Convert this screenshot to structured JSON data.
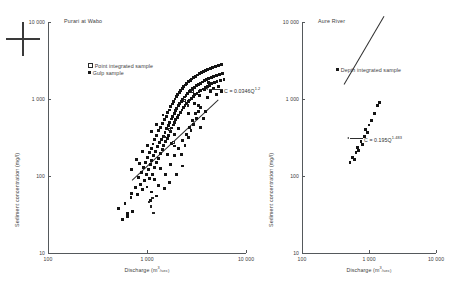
{
  "figure": {
    "registration_mark": "crosshair"
  },
  "panels": [
    {
      "id": "purari",
      "title": "Purari at Wabo",
      "xlabel_text": "Discharge (m",
      "xlabel_sup": "3",
      "xlabel_tail": "/sec)",
      "ylabel": "Sediment concentration (mg/l)",
      "xticks": [
        "100",
        "1 000",
        "10 000"
      ],
      "yticks": [
        "10",
        "100",
        "1 000",
        "10 000"
      ],
      "legend": [
        {
          "marker": "open",
          "label": "Point integrated sample"
        },
        {
          "marker": "filled",
          "label": "Gulp sample"
        }
      ],
      "equation": {
        "prefix": "C = 0.0346Q",
        "exponent": "1.2"
      }
    },
    {
      "id": "aure",
      "title": "Aure River",
      "xlabel_text": "Discharge (m",
      "xlabel_sup": "3",
      "xlabel_tail": "/sec)",
      "ylabel": "Sediment concentration (mg/l)",
      "xticks": [
        "100",
        "1 000",
        "10 000"
      ],
      "yticks": [
        "10",
        "100",
        "1 000",
        "10 000"
      ],
      "legend": [
        {
          "marker": "filled",
          "label": "Depth integrated sample"
        }
      ],
      "equation": {
        "prefix": "C = 0.195Q",
        "exponent": "1.483"
      }
    }
  ],
  "chart_data": [
    {
      "type": "scatter",
      "title": "Purari at Wabo",
      "xlabel": "Discharge (m3/sec)",
      "ylabel": "Sediment concentration (mg/l)",
      "xscale": "log",
      "yscale": "log",
      "xlim": [
        100,
        10000
      ],
      "ylim": [
        10,
        10000
      ],
      "grid": false,
      "legend_position": "upper-left-inside",
      "annotations": [
        {
          "text": "C = 0.0346Q^1.2",
          "kind": "regression-equation",
          "leader": true
        }
      ],
      "fit": {
        "coefficient": 0.0346,
        "exponent": 1.2,
        "form": "C = aQ^b"
      },
      "series": [
        {
          "name": "Gulp sample",
          "marker": "filled-square",
          "points": [
            [
              520,
              38
            ],
            [
              600,
              44
            ],
            [
              640,
              33
            ],
            [
              700,
              60
            ],
            [
              690,
              52
            ],
            [
              760,
              70
            ],
            [
              800,
              58
            ],
            [
              820,
              95
            ],
            [
              860,
              78
            ],
            [
              880,
              110
            ],
            [
              900,
              66
            ],
            [
              920,
              130
            ],
            [
              940,
              88
            ],
            [
              960,
              150
            ],
            [
              980,
              105
            ],
            [
              1000,
              72
            ],
            [
              1010,
              175
            ],
            [
              1030,
              120
            ],
            [
              1050,
              200
            ],
            [
              1060,
              92
            ],
            [
              1080,
              140
            ],
            [
              1100,
              230
            ],
            [
              1120,
              160
            ],
            [
              1140,
              105
            ],
            [
              1150,
              260
            ],
            [
              1170,
              185
            ],
            [
              1190,
              130
            ],
            [
              1200,
              300
            ],
            [
              1220,
              210
            ],
            [
              1240,
              150
            ],
            [
              1260,
              340
            ],
            [
              1280,
              240
            ],
            [
              1300,
              170
            ],
            [
              1320,
              390
            ],
            [
              1340,
              270
            ],
            [
              1360,
              195
            ],
            [
              1380,
              430
            ],
            [
              1400,
              300
            ],
            [
              1420,
              220
            ],
            [
              1440,
              480
            ],
            [
              1460,
              330
            ],
            [
              1480,
              250
            ],
            [
              1500,
              540
            ],
            [
              1520,
              370
            ],
            [
              1540,
              280
            ],
            [
              1560,
              600
            ],
            [
              1580,
              410
            ],
            [
              1600,
              310
            ],
            [
              1620,
              660
            ],
            [
              1640,
              450
            ],
            [
              1660,
              340
            ],
            [
              1680,
              720
            ],
            [
              1700,
              500
            ],
            [
              1720,
              380
            ],
            [
              1740,
              790
            ],
            [
              1760,
              550
            ],
            [
              1780,
              420
            ],
            [
              1800,
              860
            ],
            [
              1820,
              600
            ],
            [
              1840,
              460
            ],
            [
              1860,
              930
            ],
            [
              1880,
              650
            ],
            [
              1900,
              500
            ],
            [
              1920,
              1000
            ],
            [
              1940,
              700
            ],
            [
              1960,
              540
            ],
            [
              1980,
              1080
            ],
            [
              2000,
              760
            ],
            [
              2020,
              580
            ],
            [
              2050,
              1150
            ],
            [
              2080,
              820
            ],
            [
              2100,
              620
            ],
            [
              2120,
              1230
            ],
            [
              2150,
              880
            ],
            [
              2180,
              670
            ],
            [
              2200,
              1300
            ],
            [
              2230,
              940
            ],
            [
              2260,
              720
            ],
            [
              2280,
              1380
            ],
            [
              2300,
              1000
            ],
            [
              2330,
              770
            ],
            [
              2360,
              1450
            ],
            [
              2390,
              1060
            ],
            [
              2420,
              820
            ],
            [
              2450,
              1520
            ],
            [
              2480,
              1120
            ],
            [
              2500,
              870
            ],
            [
              2530,
              1600
            ],
            [
              2560,
              1180
            ],
            [
              2600,
              920
            ],
            [
              2630,
              1680
            ],
            [
              2660,
              1240
            ],
            [
              2700,
              970
            ],
            [
              2730,
              1750
            ],
            [
              2760,
              1300
            ],
            [
              2800,
              1020
            ],
            [
              2840,
              1820
            ],
            [
              2880,
              1360
            ],
            [
              2920,
              1080
            ],
            [
              2960,
              1900
            ],
            [
              3000,
              1420
            ],
            [
              3050,
              1130
            ],
            [
              3100,
              1980
            ],
            [
              3150,
              1480
            ],
            [
              3200,
              1180
            ],
            [
              3250,
              2050
            ],
            [
              3300,
              1540
            ],
            [
              3350,
              1240
            ],
            [
              3400,
              2130
            ],
            [
              3450,
              1600
            ],
            [
              3500,
              1290
            ],
            [
              3560,
              2200
            ],
            [
              3620,
              1660
            ],
            [
              3680,
              1350
            ],
            [
              3740,
              2280
            ],
            [
              3800,
              1720
            ],
            [
              3860,
              1400
            ],
            [
              3920,
              2350
            ],
            [
              3980,
              1780
            ],
            [
              4050,
              1460
            ],
            [
              4120,
              2430
            ],
            [
              4200,
              1840
            ],
            [
              4280,
              1510
            ],
            [
              4360,
              2500
            ],
            [
              4440,
              1900
            ],
            [
              4520,
              1570
            ],
            [
              4600,
              2580
            ],
            [
              4700,
              1960
            ],
            [
              4800,
              1620
            ],
            [
              4900,
              2650
            ],
            [
              5000,
              2020
            ],
            [
              5100,
              1680
            ],
            [
              5250,
              2730
            ],
            [
              5400,
              2080
            ],
            [
              5550,
              1740
            ],
            [
              5700,
              2800
            ],
            [
              5850,
              2140
            ],
            [
              6000,
              1800
            ],
            [
              900,
              210
            ],
            [
              1100,
              380
            ],
            [
              1250,
              470
            ],
            [
              1450,
              620
            ],
            [
              1600,
              190
            ],
            [
              1750,
              265
            ],
            [
              1900,
              350
            ],
            [
              2100,
              410
            ],
            [
              2300,
              290
            ],
            [
              2500,
              350
            ],
            [
              2700,
              430
            ],
            [
              2900,
              520
            ],
            [
              3100,
              640
            ],
            [
              3300,
              830
            ],
            [
              3500,
              430
            ],
            [
              3700,
              560
            ],
            [
              3900,
              690
            ],
            [
              4100,
              1050
            ],
            [
              4400,
              1250
            ],
            [
              4700,
              1380
            ],
            [
              5000,
              1150
            ],
            [
              5300,
              1450
            ],
            [
              5600,
              1250
            ],
            [
              700,
              120
            ],
            [
              780,
              165
            ],
            [
              840,
              145
            ],
            [
              1020,
              250
            ],
            [
              1180,
              90
            ],
            [
              1360,
              125
            ],
            [
              1540,
              105
            ],
            [
              1720,
              140
            ],
            [
              1880,
              185
            ],
            [
              2060,
              230
            ],
            [
              2240,
              190
            ],
            [
              2420,
              250
            ],
            [
              2600,
              320
            ],
            [
              2780,
              390
            ],
            [
              2960,
              470
            ],
            [
              3140,
              560
            ],
            [
              3320,
              680
            ],
            [
              3500,
              780
            ],
            [
              1100,
              62
            ],
            [
              1300,
              75
            ],
            [
              1500,
              68
            ],
            [
              1700,
              82
            ],
            [
              2000,
              105
            ],
            [
              2300,
              135
            ],
            [
              560,
              27
            ],
            [
              640,
              30
            ],
            [
              720,
              35
            ],
            [
              1080,
              48
            ],
            [
              1260,
              55
            ],
            [
              1900,
              245
            ],
            [
              2600,
              640
            ],
            [
              3000,
              880
            ],
            [
              3400,
              1100
            ],
            [
              3800,
              1320
            ],
            [
              4200,
              1620
            ]
          ]
        },
        {
          "name": "Point integrated sample",
          "marker": "open-square",
          "points": [
            [
              1050,
              46
            ],
            [
              1100,
              40
            ],
            [
              1130,
              52
            ],
            [
              1160,
              33
            ],
            [
              1500,
              320
            ],
            [
              1700,
              400
            ],
            [
              1850,
              270
            ],
            [
              2400,
              960
            ],
            [
              2600,
              830
            ],
            [
              2900,
              1250
            ]
          ]
        }
      ]
    },
    {
      "type": "scatter",
      "title": "Aure River",
      "xlabel": "Discharge (m3/sec)",
      "ylabel": "Sediment concentration (mg/l)",
      "xscale": "log",
      "yscale": "log",
      "xlim": [
        100,
        10000
      ],
      "ylim": [
        10,
        10000
      ],
      "grid": false,
      "legend_position": "upper-center-inside",
      "annotations": [
        {
          "text": "C = 0.195Q^1.483",
          "kind": "regression-equation",
          "leader": true
        }
      ],
      "fit": {
        "coefficient": 0.195,
        "exponent": 1.483,
        "form": "C = aQ^b"
      },
      "series": [
        {
          "name": "Depth integrated sample",
          "marker": "filled-square",
          "points": [
            [
              520,
              150
            ],
            [
              560,
              175
            ],
            [
              600,
              165
            ],
            [
              640,
              200
            ],
            [
              680,
              235
            ],
            [
              700,
              215
            ],
            [
              760,
              280
            ],
            [
              800,
              255
            ],
            [
              860,
              330
            ],
            [
              900,
              400
            ],
            [
              960,
              370
            ],
            [
              1000,
              460
            ],
            [
              1100,
              520
            ],
            [
              1200,
              640
            ],
            [
              1350,
              820
            ],
            [
              1450,
              900
            ]
          ]
        }
      ]
    }
  ]
}
